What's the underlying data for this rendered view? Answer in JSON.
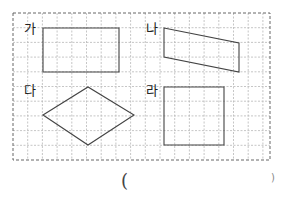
{
  "grid": {
    "left": 13,
    "top": 13,
    "right": 270,
    "bottom": 160,
    "cell": 14.7,
    "line_color": "#b8b8b8",
    "border_color": "#666666"
  },
  "shapes": [
    {
      "label": "가",
      "type": "rectangle",
      "points": [
        [
          43,
          28
        ],
        [
          119,
          28
        ],
        [
          119,
          72
        ],
        [
          43,
          72
        ]
      ],
      "label_pos": [
        24,
        22
      ]
    },
    {
      "label": "나",
      "type": "trapezoid",
      "points": [
        [
          164,
          28
        ],
        [
          239,
          43
        ],
        [
          239,
          72
        ],
        [
          164,
          57
        ]
      ],
      "label_pos": [
        146,
        22
      ]
    },
    {
      "label": "다",
      "type": "rhombus",
      "points": [
        [
          43,
          115
        ],
        [
          88,
          87
        ],
        [
          134,
          115
        ],
        [
          88,
          145
        ]
      ],
      "label_pos": [
        24,
        84
      ]
    },
    {
      "label": "라",
      "type": "square",
      "points": [
        [
          164,
          87
        ],
        [
          224,
          87
        ],
        [
          224,
          145
        ],
        [
          164,
          145
        ]
      ],
      "label_pos": [
        146,
        84
      ]
    }
  ],
  "shape_stroke": "#444444",
  "answer": {
    "open_paren": "(",
    "close_paren": ")"
  }
}
